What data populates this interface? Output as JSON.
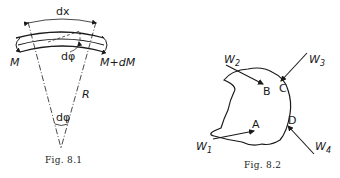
{
  "figures": [
    {
      "id": "fig-8-1",
      "caption": "Fig. 8.1",
      "labels": {
        "length": "dx",
        "moment_left": "M",
        "moment_right": "M+dM",
        "angle_top": "dφ",
        "radius": "R",
        "angle_apex": "dφ"
      }
    },
    {
      "id": "fig-8-2",
      "caption": "Fig. 8.2",
      "points": [
        "A",
        "B",
        "C",
        "D"
      ],
      "forces": [
        {
          "name": "W",
          "sub": "1",
          "target": "A"
        },
        {
          "name": "W",
          "sub": "2",
          "target": "B"
        },
        {
          "name": "W",
          "sub": "3",
          "target": "C"
        },
        {
          "name": "W",
          "sub": "4",
          "target": "D"
        }
      ]
    }
  ],
  "colors": {
    "ink": "#1a1a1a",
    "paper": "#ffffff"
  }
}
